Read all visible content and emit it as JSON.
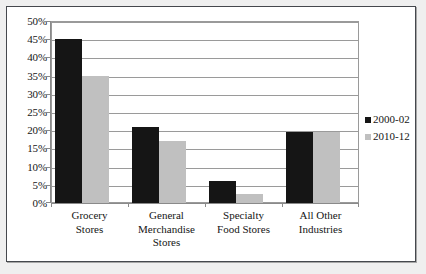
{
  "chart_data": {
    "type": "bar",
    "title": "",
    "subtitle": "",
    "xlabel": "",
    "ylabel": "",
    "categories": [
      "Grocery\nStores",
      "General\nMerchandise\nStores",
      "Specialty\nFood Stores",
      "All Other\nIndustries"
    ],
    "series": [
      {
        "name": "2000-02",
        "color": "#151515",
        "values": [
          45,
          21,
          6,
          19.5
        ]
      },
      {
        "name": "2010-12",
        "color": "#c0c0c0",
        "values": [
          35,
          17,
          2.5,
          19.5
        ]
      }
    ],
    "ylim": [
      0,
      50
    ],
    "ytick_values": [
      0,
      5,
      10,
      15,
      20,
      25,
      30,
      35,
      40,
      45,
      50
    ],
    "ytick_labels": [
      "0%",
      "5%",
      "10%",
      "15%",
      "20%",
      "25%",
      "30%",
      "35%",
      "40%",
      "45%",
      "50%"
    ],
    "grid": true,
    "grid_axis": "y",
    "legend_position": "right",
    "legend_entries": [
      "2000-02",
      "2010-12"
    ],
    "plot_background": "#ffffff",
    "page_background": "#efefef",
    "frame_color": "#45484d",
    "gridline_color": "#9a9a9a",
    "annotations": []
  }
}
